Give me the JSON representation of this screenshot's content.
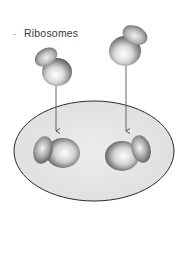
{
  "diagram": {
    "label": "Ribosomes",
    "colors": {
      "background": "#ffffff",
      "cell_fill": "#e4e4e4",
      "cell_stroke": "#2a2a2a",
      "arrow": "#555555",
      "ribosome_light": "#ffffff",
      "ribosome_dark": "#5a5a5a"
    },
    "elements": [
      {
        "type": "free-ribosome",
        "position": "upper-left"
      },
      {
        "type": "free-ribosome",
        "position": "upper-right"
      },
      {
        "type": "arrow",
        "from": "upper-left ribosome",
        "to": "lower-left ribosome"
      },
      {
        "type": "arrow",
        "from": "upper-right ribosome",
        "to": "lower-right ribosome"
      },
      {
        "type": "membrane-surface",
        "shape": "ellipse"
      },
      {
        "type": "bound-ribosome",
        "position": "lower-left"
      },
      {
        "type": "bound-ribosome",
        "position": "lower-right"
      }
    ]
  }
}
